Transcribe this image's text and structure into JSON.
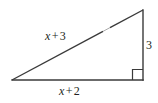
{
  "figure": {
    "type": "right-triangle-diagram",
    "background_color": "#ffffff",
    "stroke_color": "#3a3a3a",
    "text_color": "#231f20",
    "labels": {
      "hypotenuse": {
        "variable": "x",
        "operator": "+",
        "constant": "3",
        "full": "x + 3"
      },
      "base": {
        "variable": "x",
        "operator": "+",
        "constant": "2",
        "full": "x + 2"
      },
      "vertical_leg": {
        "value": "3"
      }
    },
    "marks": {
      "right_angle_marker": "right-angle-square",
      "hypotenuse_tick": "single-tick"
    },
    "geometry": {
      "left_vertex": [
        12,
        80
      ],
      "right_vertex": [
        143,
        80
      ],
      "top_vertex": [
        143,
        10
      ],
      "base_length_px": 131,
      "vertical_length_px": 70
    }
  }
}
